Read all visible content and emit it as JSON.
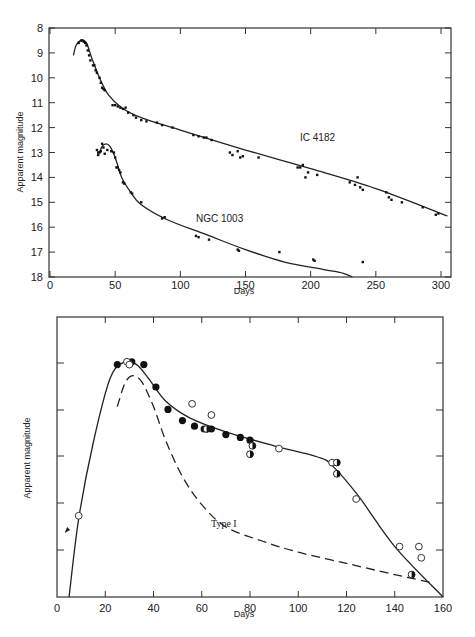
{
  "chart_data": [
    {
      "type": "scatter",
      "title": "",
      "xlabel": "Days",
      "ylabel": "Apparent magnitude",
      "xlim": [
        0,
        300
      ],
      "ylim": [
        18,
        8
      ],
      "y_inverted": true,
      "grid": false,
      "x_ticks": [
        0,
        50,
        100,
        150,
        200,
        250,
        300
      ],
      "y_ticks": [
        8,
        9,
        10,
        11,
        12,
        13,
        14,
        15,
        16,
        17,
        18
      ],
      "annotations": [
        "IC 4182",
        "NGC 1003"
      ],
      "series": [
        {
          "name": "IC 4182",
          "points": [
            [
              22,
              8.6
            ],
            [
              24,
              8.5
            ],
            [
              25,
              8.5
            ],
            [
              26,
              8.55
            ],
            [
              27,
              8.6
            ],
            [
              28,
              8.7
            ],
            [
              29,
              8.9
            ],
            [
              30,
              9.1
            ],
            [
              31,
              9.3
            ],
            [
              33,
              9.5
            ],
            [
              34,
              9.5
            ],
            [
              35,
              9.7
            ],
            [
              36,
              9.8
            ],
            [
              38,
              10.0
            ],
            [
              39,
              10.2
            ],
            [
              40,
              10.4
            ],
            [
              41,
              10.45
            ],
            [
              42,
              10.5
            ],
            [
              48,
              11.1
            ],
            [
              50,
              11.1
            ],
            [
              52,
              11.15
            ],
            [
              54,
              11.2
            ],
            [
              56,
              11.25
            ],
            [
              58,
              11.2
            ],
            [
              60,
              11.4
            ],
            [
              64,
              11.5
            ],
            [
              66,
              11.6
            ],
            [
              70,
              11.7
            ],
            [
              74,
              11.75
            ],
            [
              82,
              11.8
            ],
            [
              86,
              11.9
            ],
            [
              94,
              12.0
            ],
            [
              110,
              12.3
            ],
            [
              114,
              12.35
            ],
            [
              118,
              12.4
            ],
            [
              120,
              12.4
            ],
            [
              124,
              12.5
            ],
            [
              138,
              13.0
            ],
            [
              140,
              13.1
            ],
            [
              144,
              12.95
            ],
            [
              146,
              13.2
            ],
            [
              148,
              13.15
            ],
            [
              160,
              13.2
            ],
            [
              190,
              13.6
            ],
            [
              192,
              13.6
            ],
            [
              194,
              13.5
            ],
            [
              196,
              14.0
            ],
            [
              198,
              13.8
            ],
            [
              205,
              13.9
            ],
            [
              230,
              14.2
            ],
            [
              234,
              14.3
            ],
            [
              236,
              14.0
            ],
            [
              238,
              14.4
            ],
            [
              240,
              14.5
            ],
            [
              258,
              14.6
            ],
            [
              260,
              14.8
            ],
            [
              262,
              14.9
            ],
            [
              270,
              15.0
            ],
            [
              286,
              15.2
            ],
            [
              296,
              15.5
            ],
            [
              298,
              15.45
            ]
          ]
        },
        {
          "name": "NGC 1003",
          "points": [
            [
              36,
              12.9
            ],
            [
              37,
              13.0
            ],
            [
              37,
              13.1
            ],
            [
              38,
              13.0
            ],
            [
              39,
              12.95
            ],
            [
              40,
              12.65
            ],
            [
              41,
              12.8
            ],
            [
              42,
              13.05
            ],
            [
              44,
              12.9
            ],
            [
              47,
              12.95
            ],
            [
              49,
              13.0
            ],
            [
              50,
              13.2
            ],
            [
              51,
              13.6
            ],
            [
              52,
              13.6
            ],
            [
              53,
              13.7
            ],
            [
              54,
              13.8
            ],
            [
              56,
              14.2
            ],
            [
              57,
              14.25
            ],
            [
              62,
              14.6
            ],
            [
              63,
              14.65
            ],
            [
              70,
              15.0
            ],
            [
              86,
              15.65
            ],
            [
              88,
              15.6
            ],
            [
              112,
              16.35
            ],
            [
              114,
              16.4
            ],
            [
              122,
              16.5
            ],
            [
              144,
              16.9
            ],
            [
              145,
              16.95
            ],
            [
              176,
              17.0
            ],
            [
              202,
              17.3
            ],
            [
              203,
              17.35
            ],
            [
              240,
              17.4
            ]
          ]
        }
      ],
      "fit_curves": [
        {
          "name": "IC 4182 fit",
          "points": [
            [
              18,
              9.1
            ],
            [
              20,
              8.7
            ],
            [
              24,
              8.5
            ],
            [
              28,
              8.6
            ],
            [
              32,
              9.2
            ],
            [
              38,
              10.0
            ],
            [
              45,
              10.7
            ],
            [
              55,
              11.2
            ],
            [
              70,
              11.6
            ],
            [
              100,
              12.1
            ],
            [
              150,
              12.9
            ],
            [
              200,
              13.65
            ],
            [
              250,
              14.45
            ],
            [
              305,
              15.55
            ]
          ]
        },
        {
          "name": "NGC 1003 fit",
          "points": [
            [
              38,
              13.0
            ],
            [
              40,
              12.75
            ],
            [
              43,
              12.65
            ],
            [
              46,
              12.75
            ],
            [
              50,
              13.2
            ],
            [
              55,
              14.0
            ],
            [
              62,
              14.6
            ],
            [
              70,
              15.1
            ],
            [
              90,
              15.7
            ],
            [
              120,
              16.3
            ],
            [
              150,
              16.9
            ],
            [
              180,
              17.4
            ],
            [
              210,
              17.7
            ],
            [
              225,
              17.85
            ],
            [
              232,
              18.0
            ]
          ]
        }
      ]
    },
    {
      "type": "scatter",
      "title": "",
      "xlabel": "Days",
      "ylabel": "Apparent magnitude",
      "xlim": [
        0,
        160
      ],
      "y_ticks_count": 5,
      "y_tick_labels": [],
      "x_ticks": [
        0,
        20,
        40,
        60,
        80,
        100,
        120,
        140,
        160
      ],
      "grid": false,
      "annotations": [
        "Type I"
      ],
      "legend": "none (marker styles: filled, open, half-filled circles)",
      "series": [
        {
          "name": "filled",
          "marker": "filled-circle",
          "points_px_norm": [
            [
              25,
              0.17
            ],
            [
              31,
              0.16
            ],
            [
              36,
              0.17
            ],
            [
              41,
              0.25
            ],
            [
              46,
              0.33
            ],
            [
              52,
              0.37
            ],
            [
              57,
              0.39
            ],
            [
              61,
              0.4
            ],
            [
              64,
              0.4
            ],
            [
              70,
              0.42
            ],
            [
              76,
              0.43
            ],
            [
              80,
              0.44
            ]
          ]
        },
        {
          "name": "open",
          "marker": "open-circle",
          "points_px_norm": [
            [
              9,
              0.71
            ],
            [
              29,
              0.16
            ],
            [
              30,
              0.17
            ],
            [
              56,
              0.31
            ],
            [
              64,
              0.35
            ],
            [
              92,
              0.47
            ],
            [
              114,
              0.52
            ],
            [
              124,
              0.65
            ],
            [
              142,
              0.82
            ],
            [
              150,
              0.82
            ],
            [
              151,
              0.86
            ]
          ]
        },
        {
          "name": "half-filled",
          "marker": "half-filled-circle",
          "points_px_norm": [
            [
              62,
              0.4
            ],
            [
              81,
              0.46
            ],
            [
              80,
              0.49
            ],
            [
              116,
              0.52
            ],
            [
              116,
              0.56
            ],
            [
              147,
              0.92
            ]
          ]
        }
      ],
      "fit_curves": [
        {
          "name": "solid",
          "style": "solid",
          "points_px_norm": [
            [
              5,
              1.0
            ],
            [
              9,
              0.72
            ],
            [
              15,
              0.45
            ],
            [
              22,
              0.22
            ],
            [
              28,
              0.16
            ],
            [
              33,
              0.17
            ],
            [
              38,
              0.22
            ],
            [
              45,
              0.3
            ],
            [
              55,
              0.36
            ],
            [
              70,
              0.41
            ],
            [
              90,
              0.46
            ],
            [
              108,
              0.5
            ],
            [
              114,
              0.53
            ],
            [
              125,
              0.64
            ],
            [
              140,
              0.82
            ],
            [
              160,
              1.0
            ]
          ]
        },
        {
          "name": "Type I",
          "style": "dashed",
          "points_px_norm": [
            [
              25,
              0.32
            ],
            [
              28,
              0.24
            ],
            [
              31,
              0.21
            ],
            [
              35,
              0.23
            ],
            [
              40,
              0.32
            ],
            [
              45,
              0.44
            ],
            [
              52,
              0.57
            ],
            [
              60,
              0.67
            ],
            [
              70,
              0.75
            ],
            [
              85,
              0.8
            ],
            [
              100,
              0.84
            ],
            [
              120,
              0.88
            ],
            [
              140,
              0.92
            ],
            [
              156,
              0.95
            ]
          ]
        }
      ]
    }
  ],
  "top_chart": {
    "ylabel": "Apparent magnitude",
    "xlabel": "Days",
    "x_tick_labels": [
      "0",
      "50",
      "100",
      "150",
      "200",
      "250",
      "300"
    ],
    "y_tick_labels": [
      "8",
      "9",
      "10",
      "11",
      "12",
      "13",
      "14",
      "15",
      "16",
      "17",
      "18"
    ],
    "label_ic": "IC 4182",
    "label_ngc": "NGC 1003"
  },
  "bottom_chart": {
    "ylabel": "Apparent magnitude",
    "xlabel": "Days",
    "x_tick_labels": [
      "0",
      "20",
      "40",
      "60",
      "80",
      "100",
      "120",
      "140",
      "160"
    ],
    "label_type": "Type I"
  }
}
